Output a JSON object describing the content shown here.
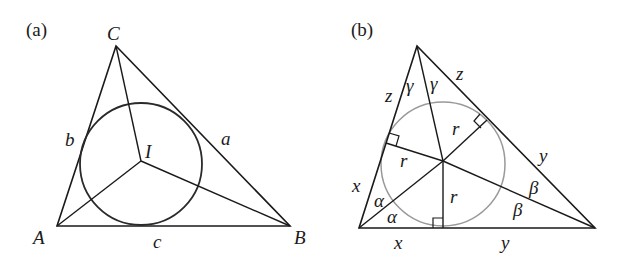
{
  "panels": [
    {
      "id": "a",
      "label": "(a)",
      "vertices": {
        "A": "A",
        "B": "B",
        "C": "C"
      },
      "incenter": "I",
      "sides": {
        "a": "a",
        "b": "b",
        "c": "c"
      },
      "circle_color": "#333333"
    },
    {
      "id": "b",
      "label": "(b)",
      "tangent_lengths": {
        "x1": "x",
        "x2": "x",
        "y1": "y",
        "y2": "y",
        "z1": "z",
        "z2": "z"
      },
      "radii": {
        "r1": "r",
        "r2": "r",
        "r3": "r"
      },
      "angles": {
        "alpha1": "α",
        "alpha2": "α",
        "beta1": "β",
        "beta2": "β",
        "gamma1": "γ",
        "gamma2": "γ"
      },
      "circle_color": "#999999"
    }
  ]
}
